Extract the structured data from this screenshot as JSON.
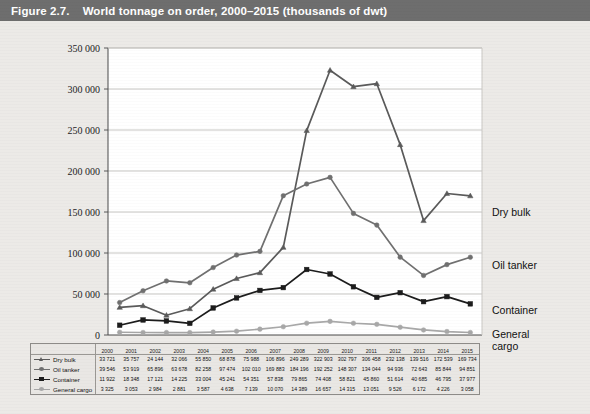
{
  "header": {
    "figure_number": "Figure 2.7.",
    "title": "World tonnage on order, 2000–2015 (thousands of dwt)",
    "bar_color": "#6e6e6e"
  },
  "series_labels": {
    "dry_bulk": "Dry bulk",
    "oil_tanker": "Oil tanker",
    "container": "Container",
    "general_cargo_line1": "General",
    "general_cargo_line2": "cargo"
  },
  "legend": {
    "items": [
      {
        "label": "Dry bulk",
        "color": "#5a5a5a",
        "marker": "triangle"
      },
      {
        "label": "Oil tanker",
        "color": "#707070",
        "marker": "circle"
      },
      {
        "label": "Container",
        "color": "#1c1c1c",
        "marker": "square"
      },
      {
        "label": "General cargo",
        "color": "#a8a8a8",
        "marker": "circle"
      }
    ]
  },
  "chart_data": {
    "type": "line",
    "title": "World tonnage on order, 2000–2015 (thousands of dwt)",
    "xlabel": "",
    "ylabel": "",
    "ylim": [
      0,
      350000
    ],
    "ytick_labels": [
      "0",
      "50 000",
      "100 000",
      "150 000",
      "200 000",
      "250 000",
      "300 000",
      "350 000"
    ],
    "ytick_values": [
      0,
      50000,
      100000,
      150000,
      200000,
      250000,
      300000,
      350000
    ],
    "grid": true,
    "legend_position": "right-of-plot",
    "categories": [
      "2000",
      "2001",
      "2002",
      "2003",
      "2004",
      "2005",
      "2006",
      "2007",
      "2008",
      "2009",
      "2010",
      "2011",
      "2012",
      "2013",
      "2014",
      "2015"
    ],
    "series": [
      {
        "name": "Dry bulk",
        "color": "#5a5a5a",
        "marker": "triangle",
        "values": [
          33721,
          35757,
          24144,
          32066,
          55850,
          68878,
          75988,
          106896,
          249289,
          322903,
          302797,
          306458,
          232138,
          139516,
          172539,
          169734
        ],
        "value_labels": [
          "33 721",
          "35 757",
          "24 144",
          "32 066",
          "55 850",
          "68 878",
          "75 988",
          "106 896",
          "249 289",
          "322 903",
          "302 797",
          "306 458",
          "232 138",
          "139 516",
          "172 539",
          "169 734"
        ]
      },
      {
        "name": "Oil tanker",
        "color": "#707070",
        "marker": "circle",
        "values": [
          39546,
          53919,
          65896,
          63678,
          82258,
          97474,
          102010,
          169883,
          184196,
          192252,
          148307,
          134044,
          94936,
          72643,
          85844,
          94851
        ],
        "value_labels": [
          "39 546",
          "53 919",
          "65 896",
          "63 678",
          "82 258",
          "97 474",
          "102 010",
          "169 883",
          "184 196",
          "192 252",
          "148 307",
          "134 044",
          "94 936",
          "72 643",
          "85 844",
          "94 851"
        ]
      },
      {
        "name": "Container",
        "color": "#1c1c1c",
        "marker": "square",
        "values": [
          11922,
          18348,
          17121,
          14225,
          33004,
          45241,
          54351,
          57838,
          79865,
          74408,
          58821,
          45860,
          51614,
          40685,
          46795,
          37977
        ],
        "value_labels": [
          "11 922",
          "18 348",
          "17 121",
          "14 225",
          "33 004",
          "45 241",
          "54 351",
          "57 838",
          "79 865",
          "74 408",
          "58 821",
          "45 860",
          "51 614",
          "40 685",
          "46 795",
          "37 977"
        ]
      },
      {
        "name": "General cargo",
        "color": "#a8a8a8",
        "marker": "circle",
        "values": [
          3325,
          3053,
          2984,
          2881,
          3587,
          4638,
          7139,
          10070,
          14389,
          16657,
          14315,
          13051,
          9526,
          6172,
          4226,
          3058
        ],
        "value_labels": [
          "3 325",
          "3 053",
          "2 984",
          "2 881",
          "3 587",
          "4 638",
          "7 139",
          "10 070",
          "14 389",
          "16 657",
          "14 315",
          "13 051",
          "9 526",
          "6 172",
          "4 226",
          "3 058"
        ]
      }
    ]
  }
}
